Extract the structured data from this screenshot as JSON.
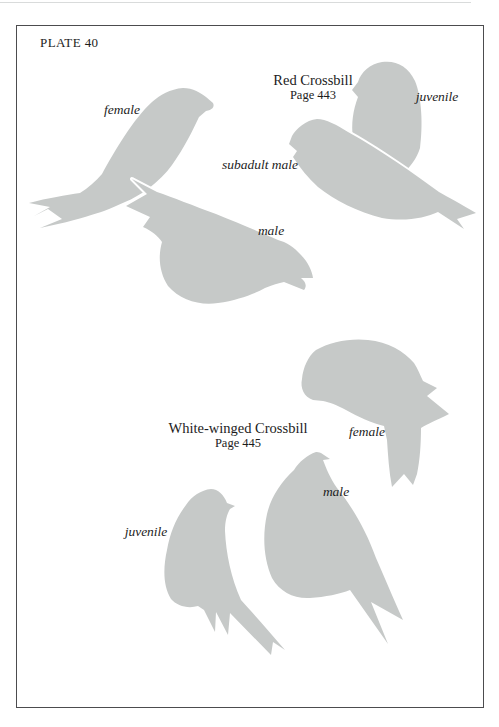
{
  "page": {
    "plate_label": "PLATE 40",
    "background_color": "#ffffff",
    "silhouette_color": "#c6c9c8",
    "frame_color": "#4c4c4e",
    "text_color": "#1c1c1c"
  },
  "red_crossbill": {
    "name": "Red Crossbill",
    "page_ref": "Page 443",
    "labels": {
      "female": "female",
      "juvenile": "juvenile",
      "subadult_male": "subadult male",
      "male": "male"
    }
  },
  "white_winged_crossbill": {
    "name": "White-winged Crossbill",
    "page_ref": "Page 445",
    "labels": {
      "female": "female",
      "male": "male",
      "juvenile": "juvenile"
    }
  }
}
